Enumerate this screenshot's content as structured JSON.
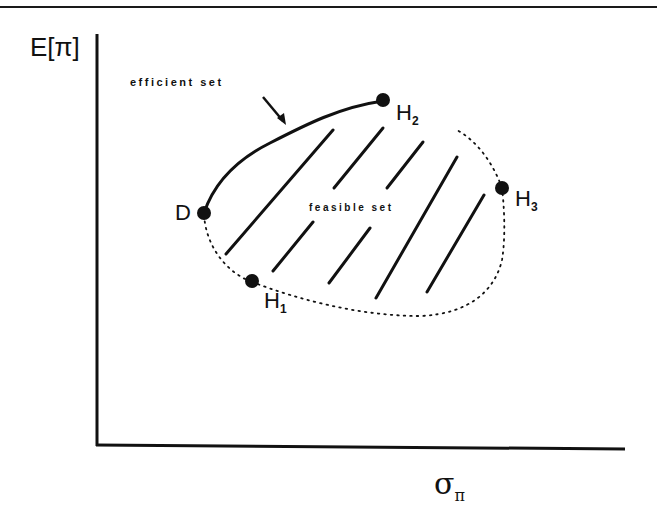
{
  "diagram": {
    "axes": {
      "y_label": "E[π]",
      "x_label_main": "σ",
      "x_label_sub": "π"
    },
    "annotations": {
      "efficient_set": "efficient set",
      "feasible_set": "feasible set"
    },
    "points": [
      {
        "id": "D",
        "label": "D",
        "sub": ""
      },
      {
        "id": "H1",
        "label": "H",
        "sub": "1"
      },
      {
        "id": "H2",
        "label": "H",
        "sub": "2"
      },
      {
        "id": "H3",
        "label": "H",
        "sub": "3"
      }
    ],
    "colors": {
      "ink": "#111111",
      "background": "#ffffff"
    }
  }
}
